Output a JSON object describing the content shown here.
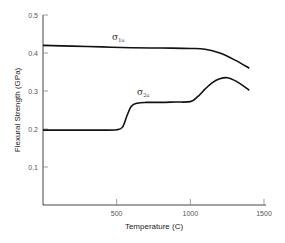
{
  "chart_data": {
    "type": "line",
    "title": "",
    "xlabel": "Temperature (C)",
    "ylabel": "Flexural Strength (GPa)",
    "xlim": [
      0,
      1500
    ],
    "ylim": [
      0,
      0.5
    ],
    "x_ticks": [
      500,
      1000,
      1500
    ],
    "x_tick_labels": [
      "500",
      "1000",
      "1500"
    ],
    "y_ticks": [
      0.1,
      0.2,
      0.3,
      0.4,
      0.5
    ],
    "y_tick_labels": [
      "0.1",
      "0.2",
      "0.3",
      "0.4",
      "0.5"
    ],
    "grid": false,
    "series": [
      {
        "name": "σ1u",
        "label_main": "σ",
        "label_sub": "1u",
        "x": [
          0,
          200,
          400,
          600,
          800,
          1000,
          1100,
          1200,
          1300,
          1400
        ],
        "y": [
          0.42,
          0.418,
          0.416,
          0.414,
          0.413,
          0.412,
          0.41,
          0.4,
          0.382,
          0.36
        ]
      },
      {
        "name": "σ2u",
        "label_main": "σ",
        "label_sub": "2u",
        "x": [
          0,
          200,
          400,
          500,
          540,
          570,
          600,
          640,
          700,
          800,
          900,
          1000,
          1050,
          1100,
          1150,
          1200,
          1250,
          1300,
          1350,
          1400
        ],
        "y": [
          0.197,
          0.197,
          0.197,
          0.198,
          0.205,
          0.235,
          0.26,
          0.268,
          0.27,
          0.27,
          0.271,
          0.272,
          0.285,
          0.305,
          0.322,
          0.332,
          0.335,
          0.328,
          0.316,
          0.302
        ]
      }
    ]
  }
}
